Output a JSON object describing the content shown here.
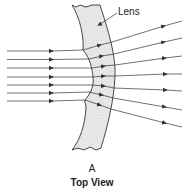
{
  "diagram": {
    "type": "optics-ray-diagram",
    "labels": {
      "lens": "Lens",
      "figure_letter": "A",
      "caption": "Top View"
    },
    "incoming_rays": {
      "count": 7,
      "direction": "left-to-right, parallel",
      "y_positions": [
        51,
        59,
        68,
        77,
        85,
        93,
        101
      ]
    },
    "outgoing_rays": {
      "count": 7,
      "behavior": "diverging",
      "end_y_positions": [
        21,
        38,
        57,
        74,
        90,
        107,
        125
      ]
    },
    "colors": {
      "line": "#333333",
      "lens_fill": "#e6e6e6",
      "text": "#222222"
    }
  }
}
